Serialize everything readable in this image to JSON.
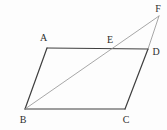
{
  "figure": {
    "background_color": "#fdfdfd",
    "main_stroke_color": "#3f3f3f",
    "thin_stroke_color": "#909090",
    "label_color": "#2e2e2e",
    "points": {
      "A": {
        "x": 47,
        "y": 48
      },
      "B": {
        "x": 25,
        "y": 109
      },
      "C": {
        "x": 125,
        "y": 109
      },
      "D": {
        "x": 148,
        "y": 49
      },
      "E": {
        "x": 112,
        "y": 49
      },
      "F": {
        "x": 159,
        "y": 16
      }
    },
    "edges": [
      {
        "name": "side-AB",
        "from": "A",
        "to": "B",
        "style": "main"
      },
      {
        "name": "side-BC",
        "from": "B",
        "to": "C",
        "style": "main"
      },
      {
        "name": "side-CD",
        "from": "C",
        "to": "D",
        "style": "main"
      },
      {
        "name": "side-AD",
        "from": "A",
        "to": "D",
        "style": "main"
      },
      {
        "name": "line-BF",
        "from": "B",
        "to": "F",
        "style": "thin"
      },
      {
        "name": "line-DF",
        "from": "D",
        "to": "F",
        "style": "thin"
      }
    ],
    "labels": [
      {
        "text": "A",
        "x": 43.5,
        "y": 41
      },
      {
        "text": "B",
        "x": 23,
        "y": 123
      },
      {
        "text": "C",
        "x": 126,
        "y": 123
      },
      {
        "text": "D",
        "x": 156,
        "y": 55
      },
      {
        "text": "E",
        "x": 110,
        "y": 43
      },
      {
        "text": "F",
        "x": 158,
        "y": 12
      }
    ]
  }
}
